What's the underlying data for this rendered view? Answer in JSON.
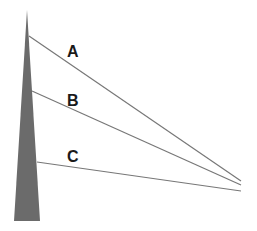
{
  "diagram": {
    "type": "tower-with-guy-wires",
    "colors": {
      "background": "#ffffff",
      "tower_fill": "#6b6b6b",
      "wire_stroke": "#777777",
      "label_color": "#1a1a1a"
    },
    "tower": {
      "top": [
        27,
        10
      ],
      "base_left": [
        14,
        221
      ],
      "base_right": [
        40,
        221
      ]
    },
    "wires": [
      {
        "label": "A",
        "start": [
          29,
          36
        ],
        "end": [
          241,
          181
        ],
        "label_pos": [
          67,
          57
        ]
      },
      {
        "label": "B",
        "start": [
          32,
          91
        ],
        "end": [
          241,
          185
        ],
        "label_pos": [
          67,
          106
        ]
      },
      {
        "label": "C",
        "start": [
          37,
          162
        ],
        "end": [
          241,
          191
        ],
        "label_pos": [
          67,
          162
        ]
      }
    ]
  }
}
